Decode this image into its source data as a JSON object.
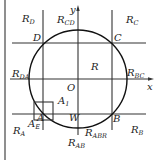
{
  "diagram": {
    "type": "region-partition diagram",
    "frame_left_line": true,
    "axes": {
      "x_label": "x",
      "y_label": "y",
      "origin_label": "O"
    },
    "points": {
      "A": "A",
      "B": "B",
      "C": "C",
      "D": "D"
    },
    "center_region": "R",
    "regions": [
      {
        "id": "RD",
        "base": "R",
        "sub": "D"
      },
      {
        "id": "RCD",
        "base": "R",
        "sub": "CD"
      },
      {
        "id": "RC",
        "base": "R",
        "sub": "C"
      },
      {
        "id": "RDA",
        "base": "R",
        "sub": "DA"
      },
      {
        "id": "RBC",
        "base": "R",
        "sub": "BC"
      },
      {
        "id": "RA",
        "base": "R",
        "sub": "A"
      },
      {
        "id": "RAB",
        "base": "R",
        "sub": "AB"
      },
      {
        "id": "RABR",
        "base": "R",
        "sub": "ABR"
      },
      {
        "id": "RB",
        "base": "R",
        "sub": "B"
      }
    ],
    "small_square_labels": {
      "A1": {
        "base": "A",
        "sub": "1"
      },
      "AE": {
        "base": "A",
        "sub": "E"
      }
    },
    "W_label": "W",
    "colors": {
      "stroke": "#333333",
      "circle": "#111111",
      "background": "#ffffff"
    }
  }
}
